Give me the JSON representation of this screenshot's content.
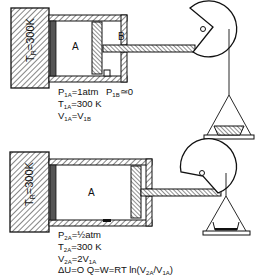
{
  "figure": {
    "top": {
      "reservoir_label": "T₀=300K",
      "reservoir_label_main": "T",
      "reservoir_label_sub": "R",
      "reservoir_label_rest": "=300K",
      "chamber_a": "A",
      "chamber_b": "B",
      "pressure_b": "P",
      "pressure_b_sub": "1B",
      "pressure_b_rest": "≃0",
      "lines": [
        {
          "main": "P",
          "sub": "1A",
          "rest": "=1atm"
        },
        {
          "main": "T",
          "sub": "1A",
          "rest": "=300 K"
        },
        {
          "main": "V",
          "sub": "1A",
          "rest": "=V",
          "sub2": "1B"
        }
      ]
    },
    "bottom": {
      "reservoir_label_main": "T",
      "reservoir_label_sub": "R",
      "reservoir_label_rest": "=300K",
      "chamber_a": "A",
      "lines": [
        {
          "main": "P",
          "sub": "2A",
          "rest": "=½atm"
        },
        {
          "main": "T",
          "sub": "2A",
          "rest": "=300 K"
        },
        {
          "main": "V",
          "sub": "2A",
          "rest": "=2V",
          "sub2": "1A"
        }
      ],
      "energy_line": "ΔU=O  Q=W=RT ln(V₂ₐ/V₁ₐ)",
      "energy_line_parts": {
        "a": "ΔU=O  Q=W=RT ln(V",
        "s1": "2A",
        "b": "/V",
        "s2": "1A",
        "c": ")"
      }
    }
  }
}
